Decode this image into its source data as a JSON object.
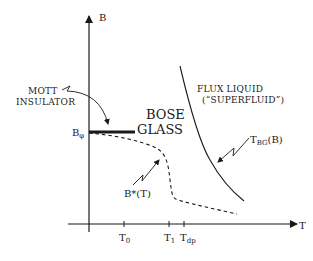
{
  "diagram": {
    "type": "phase-diagram",
    "colors": {
      "ink": "#1a1a1a",
      "background": "#ffffff"
    },
    "axes": {
      "y_label": "B",
      "x_label": "T"
    },
    "y_marker": {
      "base": "B",
      "sub": "φ"
    },
    "x_ticks": [
      {
        "base": "T",
        "sub": "0"
      },
      {
        "base": "T",
        "sub": "1"
      },
      {
        "base": "T",
        "sub": "dp"
      }
    ],
    "regions": {
      "mott_line1": "MOTT",
      "mott_line2": "INSULATOR",
      "bose_line1": "BOSE",
      "bose_line2": "GLASS",
      "flux_line1": "FLUX LIQUID",
      "flux_line2": "(“SUPERFLUID”)"
    },
    "curves": {
      "tbg": {
        "base": "T",
        "sub": "BG",
        "suffix": "(B)"
      },
      "bstar": "B*(T)"
    }
  }
}
